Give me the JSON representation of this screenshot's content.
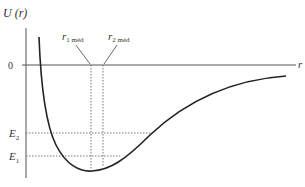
{
  "diagram": {
    "y_axis_label": "U (r)",
    "x_axis_label": "r",
    "zero_label": "0",
    "levels": [
      {
        "label": "E",
        "sub": "2"
      },
      {
        "label": "E",
        "sub": "1"
      }
    ],
    "markers": [
      {
        "label": "r",
        "sub": "1 méd"
      },
      {
        "label": "r",
        "sub": "2 méd"
      }
    ],
    "colors": {
      "curve": "#222222",
      "axis": "#555555",
      "dotted": "#777777",
      "text": "#333333"
    }
  }
}
